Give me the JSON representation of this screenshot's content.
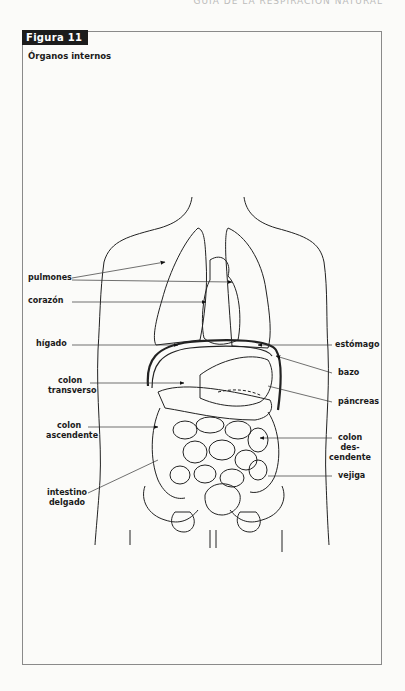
{
  "page": {
    "running_head": "Guía de la respiración natural"
  },
  "figure": {
    "tab_label": "Figura 11",
    "title": "Órganos internos",
    "labels": {
      "pulmones": "pulmones",
      "corazon": "corazón",
      "higado": "hígado",
      "colon_transverso_1": "colon",
      "colon_transverso_2": "transverso",
      "colon_ascendente_1": "colon",
      "colon_ascendente_2": "ascendente",
      "intestino_delgado_1": "intestino",
      "intestino_delgado_2": "delgado",
      "estomago": "estómago",
      "bazo": "bazo",
      "pancreas": "páncreas",
      "colon_descendente_1": "colon des-",
      "colon_descendente_2": "cendente",
      "vejiga": "vejiga"
    }
  }
}
